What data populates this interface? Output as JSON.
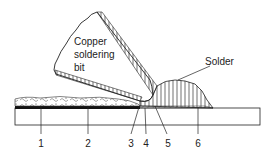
{
  "diagram": {
    "labels": {
      "bit": [
        "Copper",
        "soldering",
        "bit"
      ],
      "solder": "Solder"
    },
    "callouts": [
      "1",
      "2",
      "3",
      "4",
      "5",
      "6"
    ],
    "colors": {
      "line": "#222222",
      "background": "#ffffff"
    }
  }
}
